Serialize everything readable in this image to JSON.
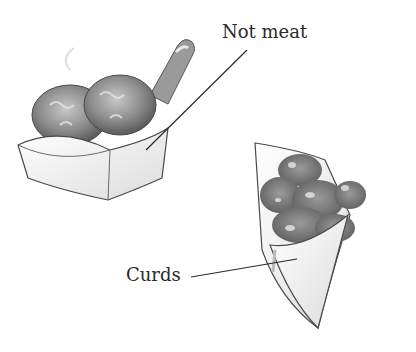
{
  "illustration": {
    "labels": {
      "not_meat": "Not meat",
      "curds": "Curds"
    },
    "objects": [
      {
        "name": "scoop-with-fried-balls",
        "description": "Paper scoop tray holding two fried breaded balls with a handle"
      },
      {
        "name": "paper-cone-with-curds",
        "description": "Paper cone filled with fried cheese curds"
      }
    ],
    "colors": {
      "ink": "#2a2a2a",
      "food_dark": "#6e6e6e",
      "food_mid": "#9a9a9a",
      "food_light": "#d0d0d0",
      "paper": "#f4f4f4"
    }
  }
}
